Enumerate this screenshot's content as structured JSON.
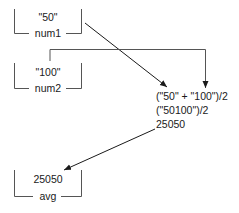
{
  "variables": [
    {
      "name": "num1",
      "value": "\"50\""
    },
    {
      "name": "num2",
      "value": "\"100\""
    },
    {
      "name": "avg",
      "value": "25050"
    }
  ],
  "evaluation": {
    "lines": [
      "(\"50\" + \"100\")/2",
      "(\"50100\")/2",
      "25050"
    ]
  },
  "colors": {
    "line": "#1a1a1a",
    "background": "#ffffff"
  }
}
